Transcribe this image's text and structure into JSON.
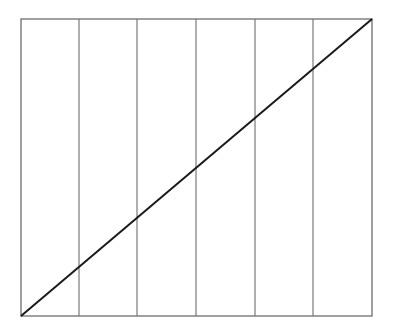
{
  "diagram": {
    "type": "grid-with-diagonal",
    "frame": {
      "x1": 21,
      "y1": 19,
      "x2": 372,
      "y2": 316
    },
    "column_count": 6,
    "vertical_dividers_x": [
      79,
      137,
      196,
      255,
      313
    ],
    "diagonal": {
      "from": "bottom-left",
      "to": "top-right"
    },
    "colors": {
      "frame": "#6e6e6e",
      "dividers": "#7a7a7a",
      "diagonal": "#1a1a1a",
      "background": "#ffffff"
    }
  }
}
